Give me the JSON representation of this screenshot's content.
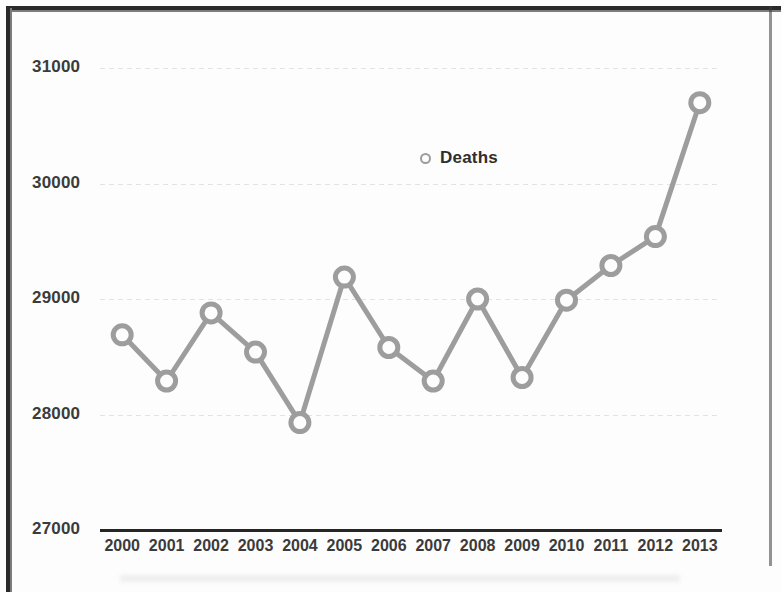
{
  "chart_data": {
    "type": "line",
    "title": "",
    "xlabel": "",
    "ylabel": "",
    "categories": [
      "2000",
      "2001",
      "2002",
      "2003",
      "2004",
      "2005",
      "2006",
      "2007",
      "2008",
      "2009",
      "2010",
      "2011",
      "2012",
      "2013"
    ],
    "series": [
      {
        "name": "Deaths",
        "values": [
          28690,
          28290,
          28880,
          28540,
          27930,
          29190,
          28580,
          28290,
          29000,
          28320,
          28990,
          29290,
          29540,
          30700
        ]
      }
    ],
    "ylim": [
      27000,
      31000
    ],
    "yticks": [
      27000,
      28000,
      29000,
      30000,
      31000
    ],
    "ytick_labels": [
      "27000",
      "28000",
      "29000",
      "30000",
      "31000"
    ],
    "grid": true,
    "legend_position": "upper-center",
    "marker": "open-circle",
    "line_color": "#9d9d9d",
    "marker_color": "#9d9d9d",
    "axis_color": "#262626",
    "grid_color": "#e3e3e3",
    "tick_label_color": "#3b3b3b"
  },
  "legend": {
    "entries": [
      {
        "label": "Deaths",
        "marker": "open-circle-marker"
      }
    ]
  }
}
